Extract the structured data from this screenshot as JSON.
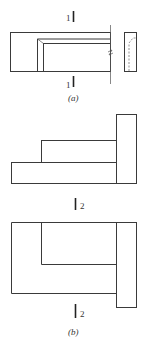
{
  "figure_a": {
    "section_label_top": "1",
    "section_label_bottom": "1",
    "caption": "(a)"
  },
  "figure_b": {
    "section_label_middle": "2",
    "section_label_bottom": "2",
    "caption": "(b)"
  }
}
